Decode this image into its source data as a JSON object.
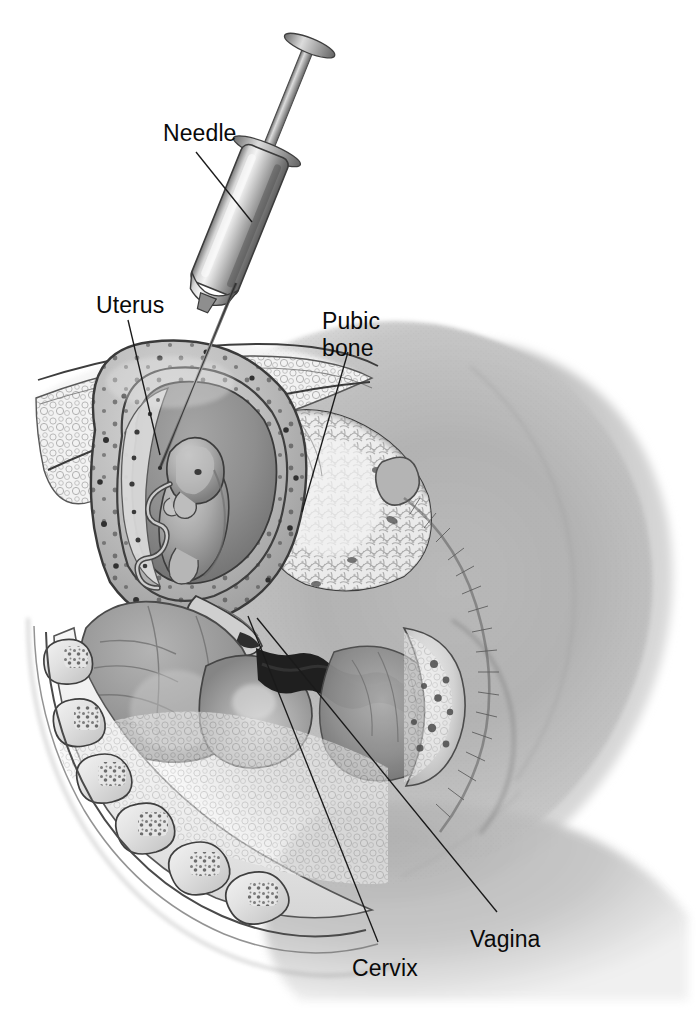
{
  "figure": {
    "background_color": "#ffffff",
    "label_color": "#0a0a0a",
    "leader_line_color": "#1a1a1a",
    "width": 696,
    "height": 1025
  },
  "labels": [
    {
      "id": "needle",
      "text": "Needle",
      "x": 163,
      "y": 120,
      "lines": 1
    },
    {
      "id": "uterus",
      "text": "Uterus",
      "x": 96,
      "y": 292,
      "lines": 1
    },
    {
      "id": "pubic_bone",
      "text": "Pubic\nbone",
      "x": 322,
      "y": 308,
      "lines": 2
    },
    {
      "id": "vagina",
      "text": "Vagina",
      "x": 470,
      "y": 926,
      "lines": 1
    },
    {
      "id": "cervix",
      "text": "Cervix",
      "x": 352,
      "y": 955,
      "lines": 1
    }
  ],
  "leader_lines": [
    {
      "id": "needle-leader",
      "x1": 196,
      "y1": 152,
      "x2": 252,
      "y2": 222
    },
    {
      "id": "uterus-leader",
      "x1": 128,
      "y1": 320,
      "x2": 160,
      "y2": 455
    },
    {
      "id": "pubic-bone-leader",
      "x1": 348,
      "y1": 352,
      "x2": 302,
      "y2": 512
    },
    {
      "id": "vagina-leader",
      "x1": 497,
      "y1": 912,
      "x2": 257,
      "y2": 618
    },
    {
      "id": "cervix-leader",
      "x1": 378,
      "y1": 942,
      "x2": 248,
      "y2": 616
    }
  ],
  "anatomy": {
    "structures": [
      "abdominal wall",
      "uterus",
      "amniotic sac",
      "fetus",
      "umbilical cord",
      "placenta",
      "pubic bone",
      "urinary bladder",
      "rectum",
      "sacrum",
      "vertebrae",
      "cervix",
      "vagina",
      "perineum"
    ],
    "instrument": "syringe with long needle",
    "style": "grayscale pencil and airbrush medical illustration"
  }
}
